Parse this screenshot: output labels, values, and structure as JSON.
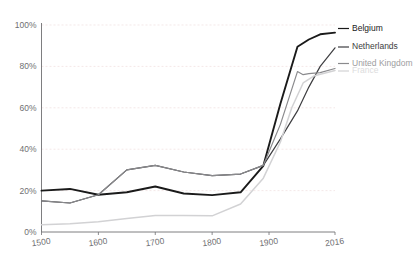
{
  "chart_data": {
    "type": "line",
    "title": "",
    "subtitle": "",
    "xlabel": "",
    "ylabel": "",
    "xlim": [
      1500,
      2016
    ],
    "ylim": [
      0,
      100
    ],
    "grid": true,
    "legend_position": "right-inline",
    "y_ticks": [
      0,
      20,
      40,
      60,
      80,
      100
    ],
    "y_tick_labels": [
      "0%",
      "20%",
      "40%",
      "60%",
      "80%",
      "100%"
    ],
    "x_ticks": [
      1500,
      1600,
      1700,
      1800,
      1900,
      2016
    ],
    "x_tick_labels": [
      "1500",
      "1600",
      "1700",
      "1800",
      "1900",
      "2016"
    ],
    "series": [
      {
        "name": "Belgium",
        "color": "#1a1a1a",
        "width": 1.9,
        "label": "Belgium",
        "x": [
          1500,
          1550,
          1600,
          1650,
          1700,
          1750,
          1800,
          1850,
          1890,
          1920,
          1950,
          1970,
          1990,
          2016
        ],
        "values": [
          20.0,
          20.8,
          18.0,
          19.2,
          22.0,
          18.6,
          17.8,
          19.2,
          32.0,
          62.0,
          89.5,
          93.0,
          95.5,
          96.3
        ]
      },
      {
        "name": "Netherlands",
        "color": "#3d3d40",
        "width": 1.2,
        "label": "Netherlands",
        "x": [
          1500,
          1550,
          1600,
          1650,
          1700,
          1750,
          1800,
          1850,
          1890,
          1920,
          1950,
          1970,
          1990,
          2016
        ],
        "values": [
          15.0,
          14.0,
          18.0,
          30.0,
          32.2,
          29.0,
          27.2,
          28.0,
          32.2,
          45.0,
          58.5,
          70.0,
          80.0,
          89.0
        ]
      },
      {
        "name": "United Kingdom",
        "color": "#8a8a8d",
        "width": 1.2,
        "label": "United Kingdom",
        "x": [
          1500,
          1550,
          1600,
          1650,
          1700,
          1750,
          1800,
          1850,
          1890,
          1920,
          1950,
          1960,
          1970,
          1990,
          2016
        ],
        "values": [
          15.0,
          14.0,
          18.0,
          30.0,
          32.2,
          29.0,
          27.2,
          28.0,
          32.2,
          52.0,
          77.5,
          76.0,
          76.5,
          77.0,
          79.0
        ]
      },
      {
        "name": "France",
        "color": "#d2d2d4",
        "width": 1.5,
        "label": "France",
        "x": [
          1500,
          1550,
          1600,
          1650,
          1700,
          1750,
          1800,
          1850,
          1890,
          1920,
          1940,
          1960,
          1980,
          2016
        ],
        "values": [
          3.5,
          4.0,
          5.0,
          6.5,
          8.0,
          8.0,
          7.8,
          13.5,
          26.0,
          43.5,
          60.0,
          72.0,
          75.5,
          78.0
        ]
      }
    ],
    "series_labels": [
      {
        "text": "Belgium",
        "color": "#1a1a1a",
        "rule_color": "#1a1a1a"
      },
      {
        "text": "Netherlands",
        "color": "#3d3d40",
        "rule_color": "#3d3d40"
      },
      {
        "text": "United Kingdom",
        "color": "#9d9da0",
        "rule_color": "#8a8a8d"
      },
      {
        "text": "France",
        "color": "#dcdcdd",
        "rule_color": "#d2d2d4"
      }
    ],
    "colors": {
      "background": "#ffffff",
      "axis": "#6f6f72",
      "grid": "#efdede",
      "tick_text": "#6f6f72"
    }
  }
}
